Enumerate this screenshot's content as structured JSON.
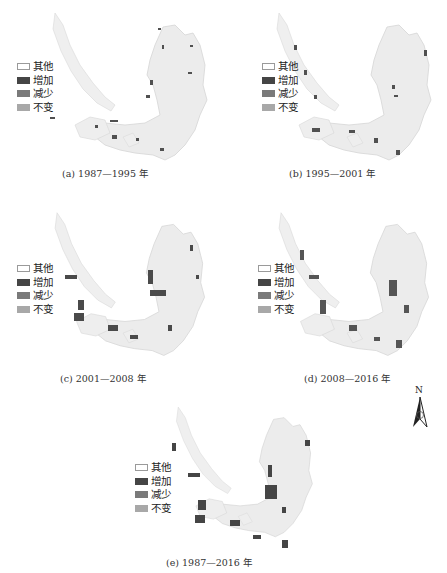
{
  "figure": {
    "legend": [
      {
        "label": "其他",
        "color": "#ffffff",
        "border": "#9a9a9a"
      },
      {
        "label": "增加",
        "color": "#454545",
        "border": "#454545"
      },
      {
        "label": "减少",
        "color": "#7a7a7a",
        "border": "#7a7a7a"
      },
      {
        "label": "不变",
        "color": "#a8a8a8",
        "border": "#a8a8a8"
      }
    ],
    "panels": [
      {
        "id": "a",
        "caption": "(a) 1987—1995 年"
      },
      {
        "id": "b",
        "caption": "(b) 1995—2001 年"
      },
      {
        "id": "c",
        "caption": "(c) 2001—2008 年"
      },
      {
        "id": "d",
        "caption": "(d) 2008—2016 年"
      },
      {
        "id": "e",
        "caption": "(e) 1987—2016 年"
      }
    ],
    "north_arrow": {
      "label": "N"
    },
    "colors": {
      "land": "#ececec",
      "coast": "#c8c8c8"
    }
  }
}
